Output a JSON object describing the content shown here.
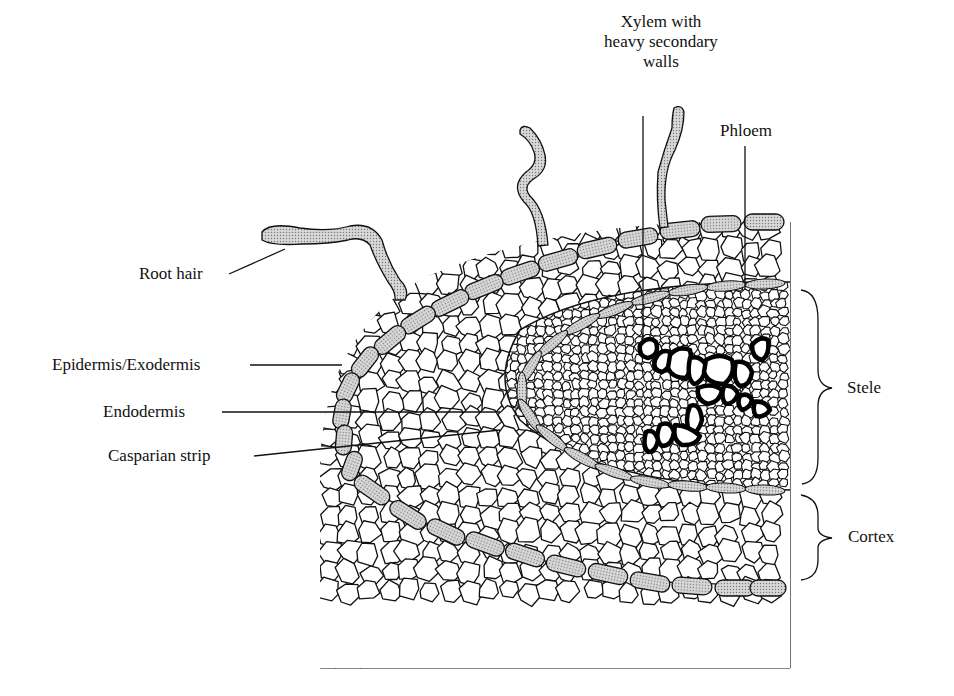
{
  "figure": {
    "type": "root-cross-section",
    "colors": {
      "ink": "#111111",
      "stipple": "#bdbdbd",
      "background": "#ffffff"
    }
  },
  "labels": {
    "xylem": [
      "Xylem with",
      "heavy secondary",
      "walls"
    ],
    "phloem": "Phloem",
    "root_hair": "Root hair",
    "epidermis": "Epidermis/Exodermis",
    "endodermis": "Endodermis",
    "casparian": "Casparian strip",
    "stele": "Stele",
    "cortex": "Cortex"
  }
}
